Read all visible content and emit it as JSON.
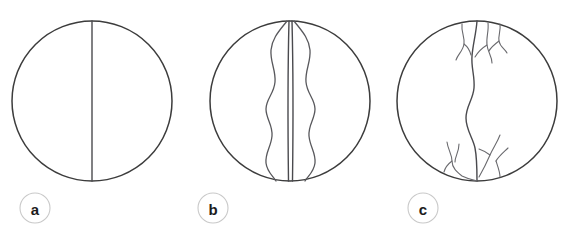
{
  "figure": {
    "background_color": "#ffffff",
    "width": 573,
    "height": 235,
    "outline_color": "#3c3c3c",
    "channel_color": "#58585c",
    "label_border_color": "#c9c9c9",
    "label_text_color": "#1c1c1c"
  },
  "panels": [
    {
      "id": "panel-a",
      "label": "a",
      "label_center": {
        "x": 35,
        "y": 208
      },
      "label_radius": 15,
      "circle": {
        "cx": 92,
        "cy": 101,
        "r": 80
      },
      "pattern": "straight",
      "channel_count": 1,
      "description": "Straight single channel drawn as a vertical diameter"
    },
    {
      "id": "panel-b",
      "label": "b",
      "label_center": {
        "x": 213,
        "y": 208
      },
      "label_radius": 15,
      "circle": {
        "cx": 290,
        "cy": 101,
        "r": 80
      },
      "pattern": "braided",
      "channel_count": 4,
      "description": "Central straight braid bar flanked by two sinuous anabranches"
    },
    {
      "id": "panel-c",
      "label": "c",
      "label_center": {
        "x": 423,
        "y": 208
      },
      "label_radius": 15,
      "circle": {
        "cx": 477,
        "cy": 101,
        "r": 80
      },
      "pattern": "meandering-dendritic",
      "channel_count": 1,
      "tributary_count": 9,
      "description": "Sinuous meandering trunk channel with dendritic tributaries at head and mouth"
    }
  ]
}
